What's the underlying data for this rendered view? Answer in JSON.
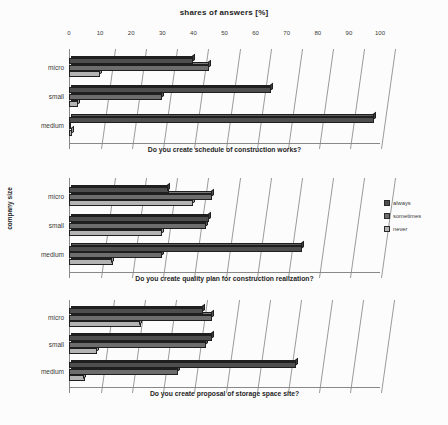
{
  "chart_data": {
    "type": "bar",
    "orientation": "horizontal",
    "title": "shares of answers [%]",
    "xlabel": "",
    "ylabel": "company size",
    "xlim": [
      0,
      100
    ],
    "xticks": [
      0,
      10,
      20,
      30,
      40,
      50,
      60,
      70,
      80,
      90,
      100
    ],
    "grid": true,
    "legend_position": "right",
    "categories": [
      "micro",
      "small",
      "medium"
    ],
    "series_names": [
      "always",
      "sometimes",
      "never"
    ],
    "series_colors": [
      "#4f4f4f",
      "#6e6e6e",
      "#b5b5b5"
    ],
    "panels": [
      {
        "title": "Do you create schedule of  construction works?",
        "series": [
          {
            "name": "always",
            "values": [
              40,
              65,
              98
            ]
          },
          {
            "name": "sometimes",
            "values": [
              45,
              30,
              0
            ]
          },
          {
            "name": "never",
            "values": [
              10,
              3,
              1
            ]
          }
        ]
      },
      {
        "title": "Do you create quality plan  for construction realization?",
        "series": [
          {
            "name": "always",
            "values": [
              32,
              45,
              75
            ]
          },
          {
            "name": "sometimes",
            "values": [
              46,
              44,
              30
            ]
          },
          {
            "name": "never",
            "values": [
              40,
              30,
              14
            ]
          }
        ]
      },
      {
        "title": "Do you create proposal of  storage space site?",
        "series": [
          {
            "name": "always",
            "values": [
              43,
              46,
              73
            ]
          },
          {
            "name": "sometimes",
            "values": [
              46,
              44,
              35
            ]
          },
          {
            "name": "never",
            "values": [
              23,
              9,
              5
            ]
          }
        ]
      }
    ]
  },
  "legend": {
    "items": [
      {
        "label": "always",
        "color": "#4f4f4f"
      },
      {
        "label": "sometimes",
        "color": "#6e6e6e"
      },
      {
        "label": "never",
        "color": "#b5b5b5"
      }
    ]
  }
}
